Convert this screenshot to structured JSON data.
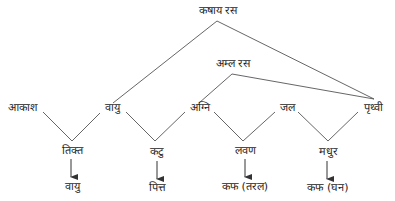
{
  "diagram": {
    "type": "rasa-origin-tree",
    "line_color": "#555555",
    "text_color": "#262626",
    "top_nodes": {
      "kashaya": {
        "label": "कषाय रस"
      },
      "amla": {
        "label": "अम्ल रस"
      }
    },
    "elements": [
      {
        "id": "akash",
        "label": "आकाश"
      },
      {
        "id": "vayu",
        "label": "वायु"
      },
      {
        "id": "agni",
        "label": "अग्नि"
      },
      {
        "id": "jal",
        "label": "जल"
      },
      {
        "id": "prithvi",
        "label": "पृथ्वी"
      }
    ],
    "rasas": [
      {
        "id": "tikta",
        "label": "तिक्त",
        "from": [
          "आकाश",
          "वायु"
        ]
      },
      {
        "id": "katu",
        "label": "कटु",
        "from": [
          "वायु",
          "अग्नि"
        ]
      },
      {
        "id": "lavan",
        "label": "लवण",
        "from": [
          "अग्नि",
          "जल"
        ]
      },
      {
        "id": "madhur",
        "label": "मधुर",
        "from": [
          "जल",
          "पृथ्वी"
        ]
      }
    ],
    "doshas": [
      {
        "rasa": "तिक्त",
        "label": "वायु"
      },
      {
        "rasa": "कटु",
        "label": "पित्त"
      },
      {
        "rasa": "लवण",
        "label": "कफ (तरल)"
      },
      {
        "rasa": "मधुर",
        "label": "कफ (घन)"
      }
    ],
    "top_edges": [
      {
        "from": "कषाय रस",
        "to": "वायु"
      },
      {
        "from": "कषाय रस",
        "to": "पृथ्वी"
      },
      {
        "from": "अम्ल रस",
        "to": "अग्नि"
      },
      {
        "from": "अम्ल रस",
        "to": "पृथ्वी"
      }
    ]
  }
}
